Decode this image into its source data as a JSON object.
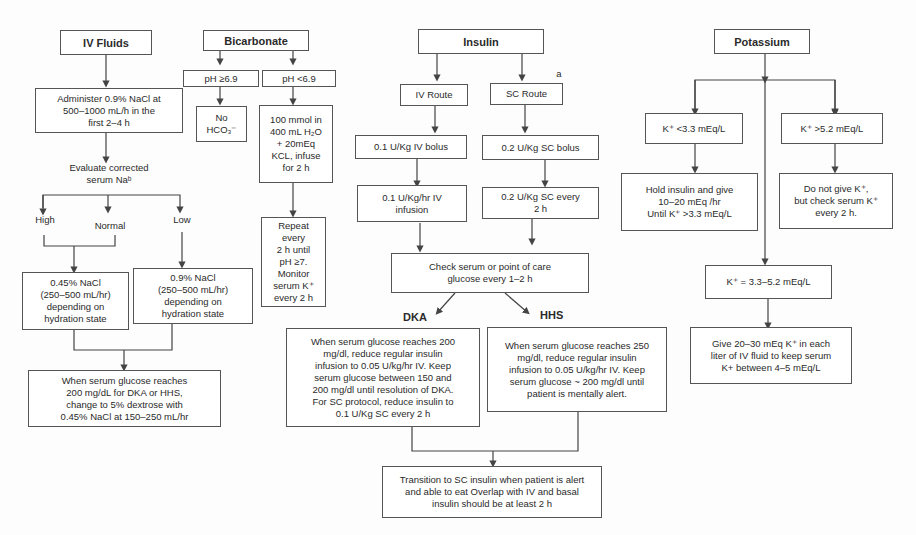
{
  "iv_fluids": {
    "title": "IV Fluids",
    "administer": "Administer 0.9% NaCl at\n500–1000 mL/h in the\nfirst 2–4 h",
    "evaluate": "Evaluate corrected\nserum Naᵇ",
    "branch_high": "High",
    "branch_normal": "Normal",
    "branch_low": "Low",
    "half_saline": "0.45% NaCl\n(250–500 mL/hr)\ndepending on\nhydration state",
    "normal_saline": "0.9% NaCl\n(250–500 mL/hr)\ndepending on\nhydration state",
    "dextrose": "When serum glucose reaches\n200 mg/dL for DKA or HHS,\nchange to 5% dextrose with\n0.45% NaCl at 150–250 mL/hr"
  },
  "bicarbonate": {
    "title": "Bicarbonate",
    "ph_high": "pH ≥6.9",
    "ph_low": "pH <6.9",
    "no_hco3": "No\nHCO₃⁻",
    "infuse": "100 mmol in\n400 mL H₂O\n+ 20mEq\nKCL, infuse\nfor 2 h",
    "repeat": "Repeat\nevery\n2 h until\npH ≥7.\nMonitor\nserum K⁺\nevery 2 h"
  },
  "insulin": {
    "title": "Insulin",
    "iv_route": "IV Route",
    "sc_route": "SC Route",
    "sc_note": "a",
    "iv_bolus": "0.1 U/Kg IV bolus",
    "sc_bolus": "0.2 U/Kg SC bolus",
    "iv_infusion": "0.1 U/Kg/hr IV\ninfusion",
    "sc_every": "0.2 U/Kg SC every\n2 h",
    "check_glucose": "Check serum or point of care\nglucose every 1–2 h",
    "dka_label": "DKA",
    "hhs_label": "HHS",
    "dka_text": "When serum glucose reaches 200\nmg/dl, reduce regular insulin\ninfusion to 0.05 U/kg/hr IV. Keep\nserum glucose between 150 and\n200 mg/dl until resolution of DKA.\nFor SC protocol, reduce insulin to\n0.1 U/Kg SC every 2 h",
    "hhs_text": "When serum glucose reaches 250\nmg/dl, reduce regular insulin\ninfusion to 0.05 U/kg/hr IV. Keep\nserum glucose ~ 200 mg/dl until\npatient is mentally alert.",
    "transition": "Transition to SC insulin when patient is alert\nand able to eat Overlap with IV and basal\ninsulin should be at least 2 h"
  },
  "potassium": {
    "title": "Potassium",
    "low": "K⁺ <3.3 mEq/L",
    "high": "K⁺ >5.2 mEq/L",
    "low_action": "Hold insulin and give\n10–20 mEq /hr\nUntil K⁺ >3.3 mEq/L",
    "high_action": "Do not give K⁺,\nbut check serum K⁺\nevery 2 h.",
    "normal": "K⁺ = 3.3–5.2 mEq/L",
    "normal_action": "Give 20–30 mEq K⁺ in each\nliter of IV fluid to keep serum\nK+ between 4–5 mEq/L"
  }
}
